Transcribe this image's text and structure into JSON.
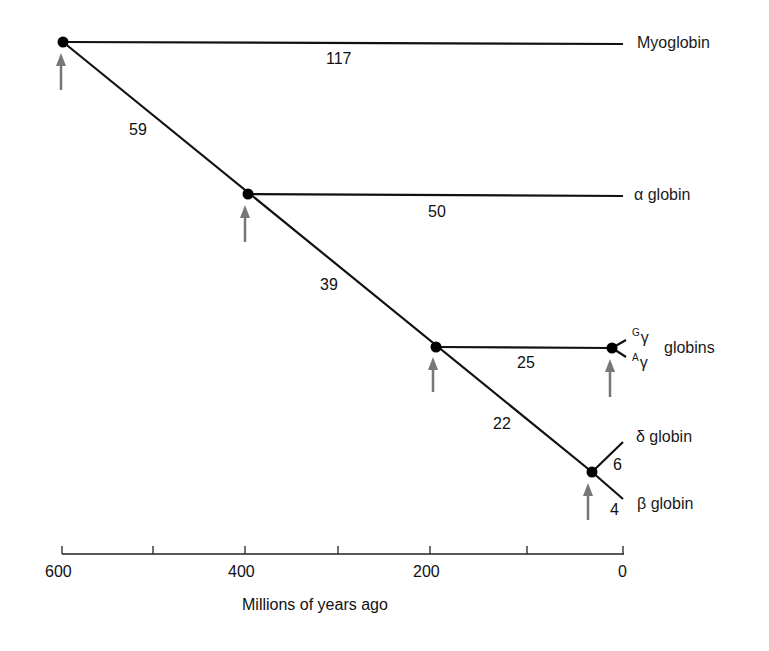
{
  "diagram": {
    "type": "phylogenetic-tree",
    "axis": {
      "label": "Millions of years ago",
      "ticks": [
        "600",
        "400",
        "200",
        "0"
      ],
      "range": [
        600,
        0
      ]
    },
    "labels": {
      "myoglobin": "Myoglobin",
      "alpha": "α globin",
      "gamma_G_sup": "G",
      "gamma_A_sup": "A",
      "gamma_glyph": "γ",
      "gamma_word": "globins",
      "delta": "δ globin",
      "beta": "β globin"
    },
    "branch_values": {
      "myoglobin": "117",
      "trunk_600_400": "59",
      "alpha": "50",
      "trunk_400_200": "39",
      "gamma": "25",
      "trunk_200_35": "22",
      "delta": "6",
      "beta": "4"
    },
    "nodes_mya": [
      600,
      400,
      200,
      35,
      20
    ]
  }
}
